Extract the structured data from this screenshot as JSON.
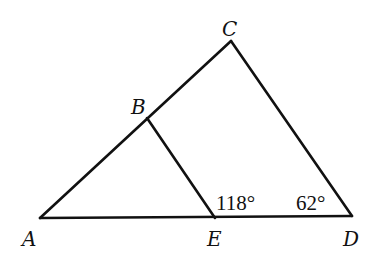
{
  "diagram": {
    "type": "geometry",
    "points": {
      "A": {
        "label": "A",
        "x": 40,
        "y": 218
      },
      "B": {
        "label": "B",
        "x": 147,
        "y": 118
      },
      "C": {
        "label": "C",
        "x": 231,
        "y": 41
      },
      "D": {
        "label": "D",
        "x": 352,
        "y": 216
      },
      "E": {
        "label": "E",
        "x": 215,
        "y": 218
      }
    },
    "segments": [
      [
        "A",
        "C"
      ],
      [
        "C",
        "D"
      ],
      [
        "A",
        "D"
      ],
      [
        "B",
        "E"
      ]
    ],
    "angles": {
      "BED": "118°",
      "CDE": "62°"
    },
    "colors": {
      "stroke": "#111111",
      "background": "#ffffff"
    }
  }
}
